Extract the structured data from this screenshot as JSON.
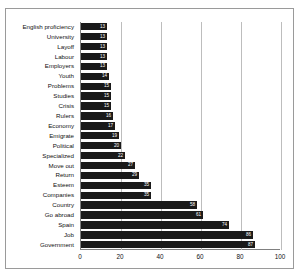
{
  "chart_data": {
    "type": "bar",
    "orientation": "horizontal",
    "title": "",
    "xlabel": "",
    "ylabel": "",
    "xlim": [
      0,
      100
    ],
    "xticks": [
      0,
      20,
      40,
      60,
      80,
      100
    ],
    "grid": true,
    "legend": false,
    "bar_color": "#1a1a1a",
    "value_labels_inside": true,
    "categories": [
      "English proficiency",
      "University",
      "Layoff",
      "Labour",
      "Employers",
      "Youth",
      "Problems",
      "Studies",
      "Crisis",
      "Rulers",
      "Economy",
      "Emigrate",
      "Political",
      "Specialized",
      "Move out",
      "Return",
      "Esteem",
      "Companies",
      "Country",
      "Go abroad",
      "Spain",
      "Job",
      "Government"
    ],
    "values": [
      13,
      13,
      13,
      13,
      13,
      14,
      15,
      15,
      15,
      16,
      17,
      19,
      20,
      22,
      27,
      29,
      35,
      35,
      58,
      61,
      74,
      86,
      87
    ]
  }
}
